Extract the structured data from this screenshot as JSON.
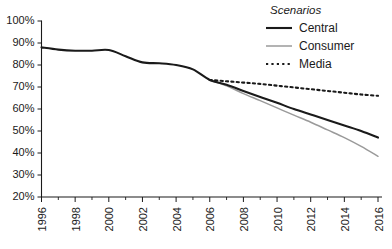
{
  "chart_data": {
    "type": "line",
    "title": "",
    "subtitle": "",
    "xlabel": "",
    "ylabel": "",
    "xlim": [
      1996,
      2016
    ],
    "ylim": [
      20,
      100
    ],
    "grid": false,
    "legend_position": "top-right",
    "legend_title": "Scenarios",
    "y_ticks": [
      "20%",
      "30%",
      "40%",
      "50%",
      "60%",
      "70%",
      "80%",
      "90%",
      "100%"
    ],
    "y_tick_values": [
      20,
      30,
      40,
      50,
      60,
      70,
      80,
      90,
      100
    ],
    "x_ticks": [
      "1996",
      "1998",
      "2000",
      "2002",
      "2004",
      "2006",
      "2008",
      "2010",
      "2012",
      "2014",
      "2016"
    ],
    "x_tick_values": [
      1996,
      1998,
      2000,
      2002,
      2004,
      2006,
      2008,
      2010,
      2012,
      2014,
      2016
    ],
    "x_minor_tick_values": [
      1997,
      1999,
      2001,
      2003,
      2005,
      2007,
      2009,
      2011,
      2013,
      2015
    ],
    "series": [
      {
        "name": "Central",
        "style": "solid",
        "color": "#1a1a1a",
        "width": 2.1,
        "x": [
          1996,
          1997,
          1998,
          1999,
          2000,
          2001,
          2002,
          2003,
          2004,
          2005,
          2006,
          2007,
          2008,
          2009,
          2010,
          2011,
          2012,
          2013,
          2014,
          2015,
          2016
        ],
        "values": [
          88,
          87,
          86.5,
          86.5,
          86.8,
          84,
          81.2,
          80.8,
          80,
          78,
          73.2,
          71,
          68.2,
          65.5,
          62.8,
          60,
          57.5,
          55,
          52.5,
          50,
          47
        ]
      },
      {
        "name": "Consumer",
        "style": "solid",
        "color": "#9a9a9a",
        "width": 1.5,
        "x": [
          2006,
          2007,
          2008,
          2009,
          2010,
          2011,
          2012,
          2013,
          2014,
          2015,
          2016
        ],
        "values": [
          73.2,
          70.5,
          67,
          63.8,
          60.5,
          57.2,
          54,
          50.5,
          47,
          43,
          38.5
        ]
      },
      {
        "name": "Media",
        "style": "dotted",
        "color": "#1a1a1a",
        "width": 2.1,
        "x": [
          2006,
          2007,
          2008,
          2009,
          2010,
          2011,
          2012,
          2013,
          2014,
          2015,
          2016
        ],
        "values": [
          73.2,
          72.6,
          72,
          71.4,
          70.6,
          69.8,
          69,
          68.2,
          67.4,
          66.6,
          66
        ]
      }
    ]
  },
  "legend": {
    "title": "Scenarios",
    "entries": [
      {
        "label": "Central",
        "color": "#1a1a1a",
        "style": "solid"
      },
      {
        "label": "Consumer",
        "color": "#9a9a9a",
        "style": "solid"
      },
      {
        "label": "Media",
        "color": "#1a1a1a",
        "style": "dotted"
      }
    ]
  }
}
